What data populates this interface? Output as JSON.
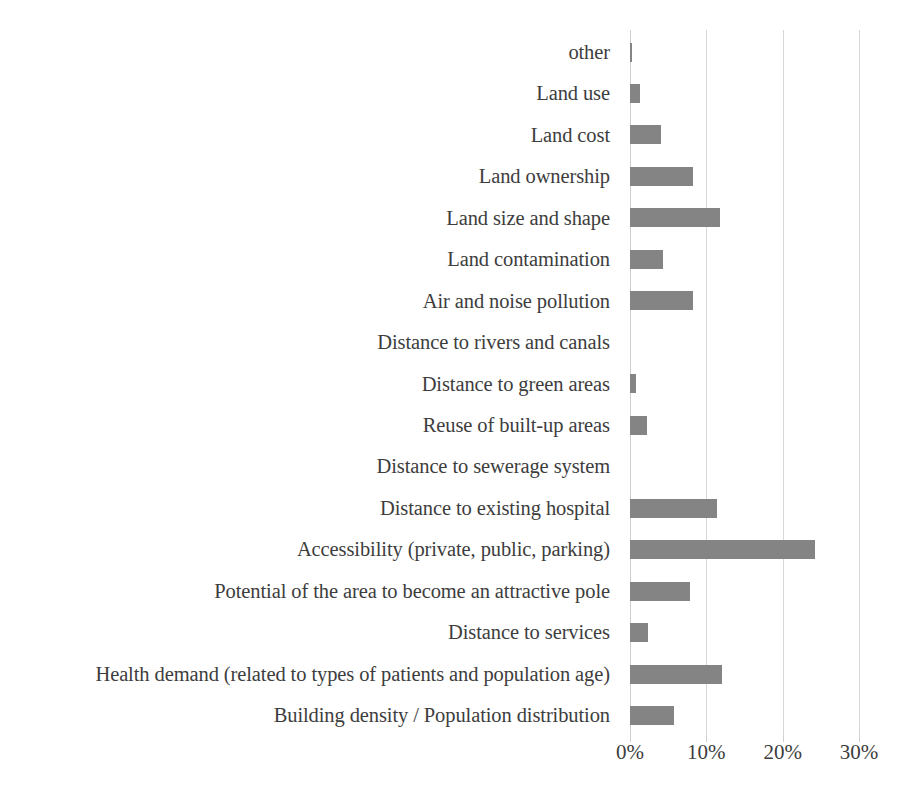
{
  "chart_data": {
    "type": "bar",
    "orientation": "horizontal",
    "title": "",
    "subtitle": "",
    "xlabel": "",
    "ylabel": "",
    "xlim": [
      0,
      30
    ],
    "xticks": [
      0,
      10,
      20,
      30
    ],
    "xtick_labels": [
      "0%",
      "10%",
      "20%",
      "30%"
    ],
    "grid": true,
    "legend": false,
    "bar_color": "#848484",
    "gridline_color": "#d8d8d8",
    "text_color": "#3d3d3d",
    "categories": [
      "other",
      "Land use",
      "Land cost",
      "Land ownership",
      "Land size and shape",
      "Land contamination",
      "Air and noise pollution",
      "Distance to rivers and canals",
      "Distance to green areas",
      "Reuse of built-up areas",
      "Distance to sewerage system",
      "Distance to existing hospital",
      "Accessibility (private, public, parking)",
      "Potential of the area to become an attractive pole",
      "Distance to services",
      "Health demand (related to types of patients and population age)",
      "Building density / Population distribution"
    ],
    "values": [
      0.3,
      1.3,
      4.1,
      8.2,
      11.8,
      4.3,
      8.3,
      0.0,
      0.8,
      2.2,
      0.0,
      11.4,
      24.2,
      7.9,
      2.3,
      12.1,
      5.7
    ]
  }
}
